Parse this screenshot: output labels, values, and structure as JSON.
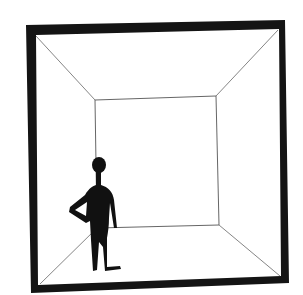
{
  "illustration": {
    "title": "Figure standing in a room drawn in one-point perspective",
    "colors": {
      "frame": "#141414",
      "lines": "#555555",
      "figure": "#111111",
      "background": "#ffffff"
    }
  }
}
